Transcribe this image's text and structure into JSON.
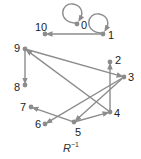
{
  "diagram": {
    "caption": {
      "base": "R",
      "superscript": "−1"
    },
    "colors": {
      "edge": "#8c8c8c",
      "node": "#8c8c8c",
      "label": "#222222"
    },
    "nodes": [
      {
        "id": "0",
        "label": "0",
        "x": 77,
        "y": 24,
        "lx": 81,
        "ly": 20
      },
      {
        "id": "1",
        "label": "1",
        "x": 103,
        "y": 34,
        "lx": 108,
        "ly": 30
      },
      {
        "id": "10",
        "label": "10",
        "x": 45,
        "y": 34,
        "lx": 35,
        "ly": 22
      },
      {
        "id": "9",
        "label": "9",
        "x": 25,
        "y": 49,
        "lx": 14,
        "ly": 43
      },
      {
        "id": "2",
        "label": "2",
        "x": 110,
        "y": 62,
        "lx": 115,
        "ly": 55
      },
      {
        "id": "3",
        "label": "3",
        "x": 124,
        "y": 77,
        "lx": 128,
        "ly": 72
      },
      {
        "id": "8",
        "label": "8",
        "x": 25,
        "y": 85,
        "lx": 14,
        "ly": 82
      },
      {
        "id": "4",
        "label": "4",
        "x": 110,
        "y": 112,
        "lx": 114,
        "ly": 108
      },
      {
        "id": "7",
        "label": "7",
        "x": 31,
        "y": 107,
        "lx": 20,
        "ly": 102
      },
      {
        "id": "6",
        "label": "6",
        "x": 45,
        "y": 124,
        "lx": 35,
        "ly": 119
      },
      {
        "id": "5",
        "label": "5",
        "x": 74,
        "y": 122,
        "lx": 75,
        "ly": 127
      }
    ],
    "edges": [
      {
        "from": "0",
        "to": "0"
      },
      {
        "from": "1",
        "to": "1"
      },
      {
        "from": "1",
        "to": "10"
      },
      {
        "from": "9",
        "to": "8"
      },
      {
        "from": "9",
        "to": "3"
      },
      {
        "from": "4",
        "to": "9"
      },
      {
        "from": "4",
        "to": "2"
      },
      {
        "from": "3",
        "to": "6"
      },
      {
        "from": "3",
        "to": "5"
      },
      {
        "from": "5",
        "to": "7"
      },
      {
        "from": "5",
        "to": "4"
      }
    ]
  }
}
